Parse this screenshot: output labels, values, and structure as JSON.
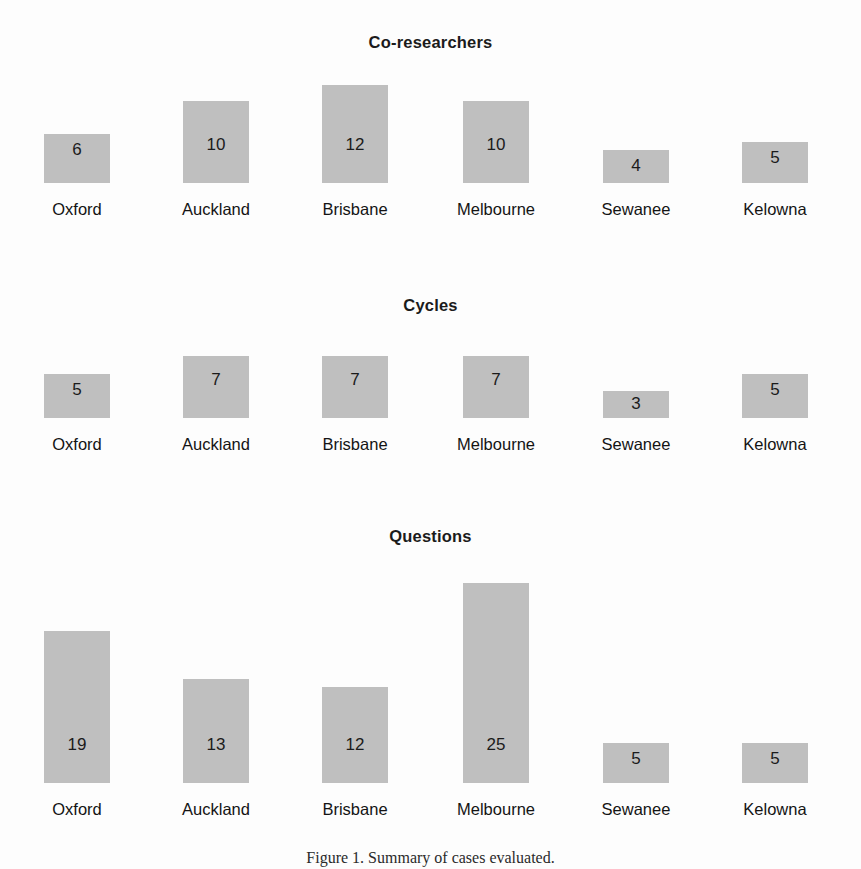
{
  "figure": {
    "background_color": "#fdfdfd",
    "bar_color": "#bfbfbf",
    "text_color": "#1b1b1b",
    "caption": "Figure 1. Summary of cases evaluated."
  },
  "chart_data": [
    {
      "type": "bar",
      "title": "Co-researchers",
      "categories": [
        "Oxford",
        "Auckland",
        "Brisbane",
        "Melbourne",
        "Sewanee",
        "Kelowna"
      ],
      "values": [
        6,
        10,
        12,
        10,
        4,
        5
      ],
      "xlabel": "",
      "ylabel": "",
      "ylim": [
        0,
        12
      ],
      "grid": false,
      "legend": "none",
      "data_labels": [
        "6",
        "10",
        "12",
        "10",
        "4",
        "5"
      ]
    },
    {
      "type": "bar",
      "title": "Cycles",
      "categories": [
        "Oxford",
        "Auckland",
        "Brisbane",
        "Melbourne",
        "Sewanee",
        "Kelowna"
      ],
      "values": [
        5,
        7,
        7,
        7,
        3,
        5
      ],
      "xlabel": "",
      "ylabel": "",
      "ylim": [
        0,
        7
      ],
      "grid": false,
      "legend": "none",
      "data_labels": [
        "5",
        "7",
        "7",
        "7",
        "3",
        "5"
      ]
    },
    {
      "type": "bar",
      "title": "Questions",
      "categories": [
        "Oxford",
        "Auckland",
        "Brisbane",
        "Melbourne",
        "Sewanee",
        "Kelowna"
      ],
      "values": [
        19,
        13,
        12,
        25,
        5,
        5
      ],
      "xlabel": "",
      "ylabel": "",
      "ylim": [
        0,
        25
      ],
      "grid": false,
      "legend": "none",
      "data_labels": [
        "19",
        "13",
        "12",
        "25",
        "5",
        "5"
      ]
    }
  ],
  "panels": [
    {
      "title": "Co-researchers",
      "title_top": 33,
      "plot_top": 70,
      "plot_height": 113,
      "label_top": 200,
      "max_value": 12,
      "max_bar_px": 98,
      "bars": [
        {
          "label": "Oxford",
          "value": 6,
          "value_text": "6",
          "center": 77,
          "width": 66
        },
        {
          "label": "Auckland",
          "value": 10,
          "value_text": "10",
          "center": 216,
          "width": 66
        },
        {
          "label": "Brisbane",
          "value": 12,
          "value_text": "12",
          "center": 355,
          "width": 66
        },
        {
          "label": "Melbourne",
          "value": 10,
          "value_text": "10",
          "center": 496,
          "width": 66
        },
        {
          "label": "Sewanee",
          "value": 4,
          "value_text": "4",
          "center": 636,
          "width": 66
        },
        {
          "label": "Kelowna",
          "value": 5,
          "value_text": "5",
          "center": 775,
          "width": 66
        }
      ]
    },
    {
      "title": "Cycles",
      "title_top": 296,
      "plot_top": 340,
      "plot_height": 78,
      "label_top": 435,
      "max_value": 7,
      "max_bar_px": 62,
      "bars": [
        {
          "label": "Oxford",
          "value": 5,
          "value_text": "5",
          "center": 77,
          "width": 66
        },
        {
          "label": "Auckland",
          "value": 7,
          "value_text": "7",
          "center": 216,
          "width": 66
        },
        {
          "label": "Brisbane",
          "value": 7,
          "value_text": "7",
          "center": 355,
          "width": 66
        },
        {
          "label": "Melbourne",
          "value": 7,
          "value_text": "7",
          "center": 496,
          "width": 66
        },
        {
          "label": "Sewanee",
          "value": 3,
          "value_text": "3",
          "center": 636,
          "width": 66
        },
        {
          "label": "Kelowna",
          "value": 5,
          "value_text": "5",
          "center": 775,
          "width": 66
        }
      ]
    },
    {
      "title": "Questions",
      "title_top": 527,
      "plot_top": 578,
      "plot_height": 205,
      "label_top": 800,
      "max_value": 25,
      "max_bar_px": 200,
      "bars": [
        {
          "label": "Oxford",
          "value": 19,
          "value_text": "19",
          "center": 77,
          "width": 66
        },
        {
          "label": "Auckland",
          "value": 13,
          "value_text": "13",
          "center": 216,
          "width": 66
        },
        {
          "label": "Brisbane",
          "value": 12,
          "value_text": "12",
          "center": 355,
          "width": 66
        },
        {
          "label": "Melbourne",
          "value": 25,
          "value_text": "25",
          "center": 496,
          "width": 66
        },
        {
          "label": "Sewanee",
          "value": 5,
          "value_text": "5",
          "center": 636,
          "width": 66
        },
        {
          "label": "Kelowna",
          "value": 5,
          "value_text": "5",
          "center": 775,
          "width": 66
        }
      ]
    }
  ]
}
